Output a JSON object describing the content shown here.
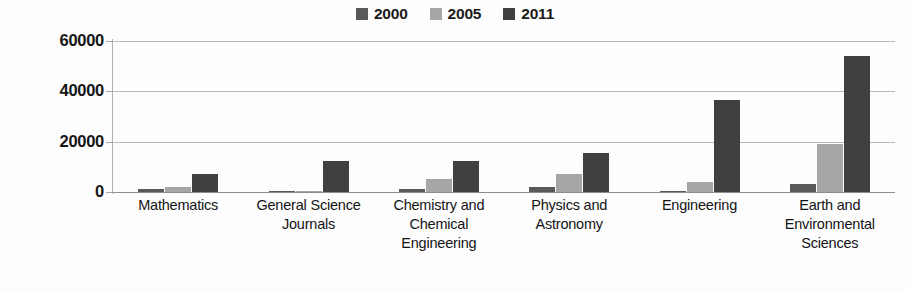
{
  "chart_data": {
    "type": "bar",
    "title": "",
    "xlabel": "",
    "ylabel": "",
    "ylim": [
      0,
      60000
    ],
    "yticks": [
      "0",
      "20000",
      "40000",
      "60000"
    ],
    "grid": true,
    "legend_position": "top-center",
    "categories": [
      "Mathematics",
      "General Science Journals",
      "Chemistry and Chemical Engineering",
      "Physics and Astronomy",
      "Engineering",
      "Earth and Environmental Sciences"
    ],
    "category_lines": [
      [
        "Mathematics"
      ],
      [
        "General Science",
        "Journals"
      ],
      [
        "Chemistry and",
        "Chemical",
        "Engineering"
      ],
      [
        "Physics and",
        "Astronomy"
      ],
      [
        "Engineering"
      ],
      [
        "Earth and",
        "Environmental",
        "Sciences"
      ]
    ],
    "series": [
      {
        "name": "2000",
        "color": "#595959",
        "values": [
          1000,
          300,
          1200,
          2000,
          500,
          3300
        ]
      },
      {
        "name": "2005",
        "color": "#a6a6a6",
        "values": [
          2000,
          400,
          5000,
          7000,
          4000,
          19000
        ]
      },
      {
        "name": "2011",
        "color": "#404040",
        "values": [
          7000,
          12500,
          12500,
          15500,
          36500,
          54000
        ]
      }
    ]
  },
  "legend": {
    "entries": [
      {
        "label": "2000",
        "color": "#595959"
      },
      {
        "label": "2005",
        "color": "#a6a6a6"
      },
      {
        "label": "2011",
        "color": "#404040"
      }
    ]
  },
  "axis": {
    "y_ticks": [
      "60000",
      "40000",
      "20000",
      "0"
    ]
  }
}
